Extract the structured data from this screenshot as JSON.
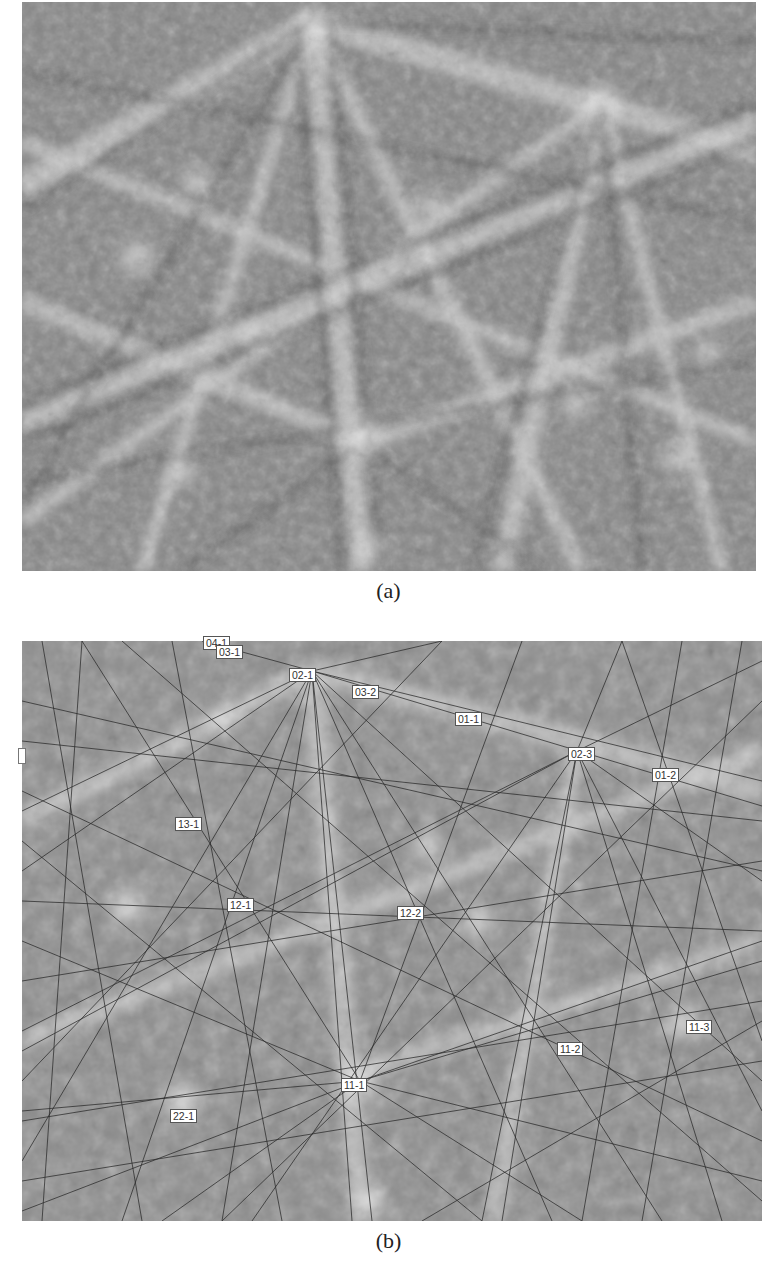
{
  "figure": {
    "panels": [
      {
        "id": "a",
        "caption": "(a)",
        "description": "Electron backscatter diffraction (Kikuchi) pattern, raw grayscale"
      },
      {
        "id": "b",
        "caption": "(b)",
        "description": "Same pattern with indexed Kikuchi band lines overlaid and zone-axis labels",
        "labels": [
          {
            "text": "04-1",
            "x": 203,
            "y": 641
          },
          {
            "text": "03-1",
            "x": 216,
            "y": 646
          },
          {
            "text": "02-1",
            "x": 289,
            "y": 669
          },
          {
            "text": "03-2",
            "x": 352,
            "y": 686
          },
          {
            "text": "01-1",
            "x": 455,
            "y": 713
          },
          {
            "text": "02-3",
            "x": 568,
            "y": 748
          },
          {
            "text": "01-2",
            "x": 652,
            "y": 769
          },
          {
            "text": "13-1",
            "x": 175,
            "y": 817
          },
          {
            "text": "12-1",
            "x": 227,
            "y": 898
          },
          {
            "text": "12-2",
            "x": 397,
            "y": 907
          },
          {
            "text": "11-3",
            "x": 686,
            "y": 1020
          },
          {
            "text": "11-2",
            "x": 557,
            "y": 1042
          },
          {
            "text": "11-1",
            "x": 341,
            "y": 1078
          },
          {
            "text": "22-1",
            "x": 170,
            "y": 1109
          }
        ]
      }
    ]
  }
}
